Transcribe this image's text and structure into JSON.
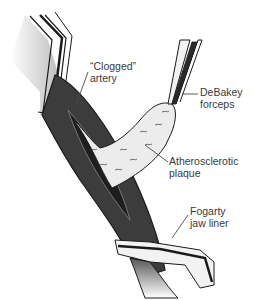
{
  "diagram": {
    "labels": [
      {
        "id": "clogged-artery",
        "lines": [
          "“Clogged”",
          "artery"
        ],
        "x": 90,
        "y": 60
      },
      {
        "id": "debakey-forceps",
        "lines": [
          "DeBakey",
          "forceps"
        ],
        "x": 200,
        "y": 86
      },
      {
        "id": "atherosclerotic-plaque",
        "lines": [
          "Atherosclerotic",
          "plaque"
        ],
        "x": 169,
        "y": 155
      },
      {
        "id": "fogarty-jaw-liner",
        "lines": [
          "Fogarty",
          "jaw liner"
        ],
        "x": 190,
        "y": 205
      }
    ],
    "colors": {
      "artery": "#3c3c3c",
      "artery_inner": "#1e1e1e",
      "plaque": "#ececec",
      "instrument": "#f2f2f2",
      "outline": "#1a1a1a",
      "leader": "#4a4a4a",
      "text": "#3a3a3a"
    }
  }
}
